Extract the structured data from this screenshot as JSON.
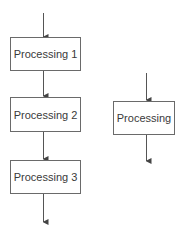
{
  "diagram": {
    "left_flow": {
      "steps": [
        {
          "label": "Processing 1"
        },
        {
          "label": "Processing 2"
        },
        {
          "label": "Processing 3"
        }
      ]
    },
    "right_flow": {
      "steps": [
        {
          "label": "Processing"
        }
      ]
    },
    "colors": {
      "line": "#555555",
      "box_border": "#6a6a6a",
      "text": "#3a3a3a"
    }
  }
}
